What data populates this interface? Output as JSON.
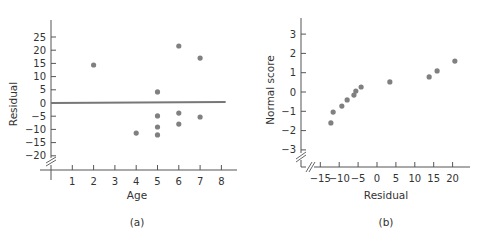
{
  "colors": {
    "axis": "#555555",
    "point": "#808080",
    "fit_line": "#777777",
    "text": "#333333",
    "background": "#ffffff"
  },
  "chart_data": [
    {
      "id": "a",
      "type": "scatter",
      "panel_label": "(a)",
      "title": "",
      "xlabel": "Age",
      "ylabel": "Residual",
      "xlim": [
        0,
        8.7
      ],
      "ylim": [
        -20,
        30
      ],
      "x_ticks": [
        1,
        2,
        3,
        4,
        5,
        6,
        7,
        8
      ],
      "x_tick_labels": [
        "1",
        "2",
        "3",
        "4",
        "5",
        "6",
        "7",
        "8"
      ],
      "y_ticks": [
        -20,
        -15,
        -10,
        -5,
        0,
        5,
        10,
        15,
        20,
        25
      ],
      "y_tick_labels": [
        "−20",
        "−15",
        "−10",
        "−5",
        "0",
        "5",
        "10",
        "15",
        "20",
        "25"
      ],
      "grid": false,
      "axis_break": "y",
      "reference_line": {
        "x": [
          0,
          8.2
        ],
        "y": [
          0,
          0.4
        ],
        "label": "fitted residual line near zero"
      },
      "points": [
        {
          "x": 2,
          "y": 14.4
        },
        {
          "x": 4,
          "y": -11.4
        },
        {
          "x": 5,
          "y": 4.2
        },
        {
          "x": 5,
          "y": -4.9
        },
        {
          "x": 5,
          "y": -9.1
        },
        {
          "x": 5,
          "y": -12.1
        },
        {
          "x": 6,
          "y": 21.6
        },
        {
          "x": 6,
          "y": -3.8
        },
        {
          "x": 6,
          "y": -8.0
        },
        {
          "x": 7,
          "y": 17.0
        },
        {
          "x": 7,
          "y": -5.3
        }
      ]
    },
    {
      "id": "b",
      "type": "scatter",
      "panel_label": "(b)",
      "title": "",
      "xlabel": "Residual",
      "ylabel": "Normal score",
      "xlim": [
        -19,
        25
      ],
      "ylim": [
        -3.5,
        3.8
      ],
      "x_ticks": [
        -15,
        -10,
        -5,
        0,
        5,
        10,
        15,
        20
      ],
      "x_tick_labels": [
        "−15",
        "−10",
        "−5",
        "0",
        "5",
        "10",
        "15",
        "20"
      ],
      "y_ticks": [
        -3,
        -2,
        -1,
        0,
        1,
        2,
        3
      ],
      "y_tick_labels": [
        "−3",
        "−2",
        "−1",
        "0",
        "1",
        "2",
        "3"
      ],
      "grid": false,
      "axis_break": "both",
      "points": [
        {
          "x": -12.2,
          "y": -1.6
        },
        {
          "x": -11.6,
          "y": -1.04
        },
        {
          "x": -9.3,
          "y": -0.73
        },
        {
          "x": -7.9,
          "y": -0.41
        },
        {
          "x": -6.1,
          "y": -0.16
        },
        {
          "x": -5.6,
          "y": 0.05
        },
        {
          "x": -4.2,
          "y": 0.26
        },
        {
          "x": 3.4,
          "y": 0.52
        },
        {
          "x": 13.8,
          "y": 0.78
        },
        {
          "x": 15.9,
          "y": 1.09
        },
        {
          "x": 20.6,
          "y": 1.6
        }
      ]
    }
  ]
}
